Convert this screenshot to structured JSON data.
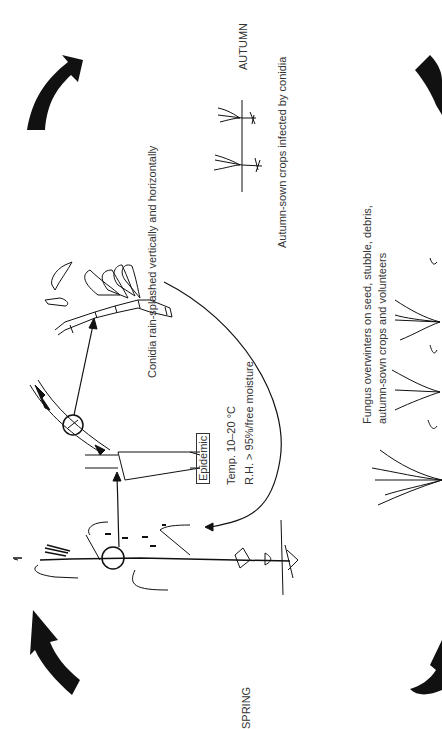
{
  "diagram": {
    "orientation": "rotated 90deg counterclockwise",
    "seasons": {
      "spring": "SPRING",
      "autumn": "AUTUMN"
    },
    "labels": {
      "conidia_splash": "Conidia rain-splashed vertically and horizontally",
      "autumn_infection": "Autumn-sown crops infected by conidia",
      "overwinter_line1": "Fungus overwinters on seed, stubble, debris,",
      "overwinter_line2": "autumn-sown crops and volunteers",
      "epidemic": "Epidemic",
      "temp": "Temp. 10–20 °C",
      "humidity": "R.H. > 95%/free moisture"
    },
    "stages": [
      {
        "name": "spring-mature-plant",
        "desc": "Mature cereal plant with lesion circled"
      },
      {
        "name": "leaf-lesion-detail",
        "desc": "Enlarged stem/leaf with lesions"
      },
      {
        "name": "conidiophore-conidia",
        "desc": "Septate hypha with conidia"
      },
      {
        "name": "autumn-seedlings",
        "desc": "Two seedlings in soil"
      },
      {
        "name": "overwintering-plants",
        "desc": "Tillering plants with debris"
      }
    ],
    "colors": {
      "ink": "#111111",
      "background": "#ffffff"
    }
  }
}
